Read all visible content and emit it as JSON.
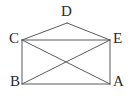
{
  "figure": {
    "type": "geometry-diagram",
    "background_color": "#ffffff",
    "stroke_color": "#5a5a5a",
    "label_color": "#2b2b2b",
    "stroke_width": 1,
    "vertices": [
      {
        "id": "D",
        "label": "D",
        "x": 67,
        "y": 23,
        "label_x": 61,
        "label_y": 4
      },
      {
        "id": "C",
        "label": "C",
        "x": 22,
        "y": 40,
        "label_x": 9,
        "label_y": 31
      },
      {
        "id": "E",
        "label": "E",
        "x": 110,
        "y": 40,
        "label_x": 113,
        "label_y": 31
      },
      {
        "id": "B",
        "label": "B",
        "x": 22,
        "y": 84,
        "label_x": 10,
        "label_y": 74
      },
      {
        "id": "A",
        "label": "A",
        "x": 110,
        "y": 84,
        "label_x": 113,
        "label_y": 74
      }
    ],
    "edges": [
      {
        "name": "edge-C-D",
        "from": "C",
        "to": "D",
        "x1": 22,
        "y1": 40,
        "x2": 67,
        "y2": 23
      },
      {
        "name": "edge-D-E",
        "from": "D",
        "to": "E",
        "x1": 67,
        "y1": 23,
        "x2": 110,
        "y2": 40
      },
      {
        "name": "edge-C-E",
        "from": "C",
        "to": "E",
        "x1": 22,
        "y1": 40,
        "x2": 110,
        "y2": 40
      },
      {
        "name": "edge-C-B",
        "from": "C",
        "to": "B",
        "x1": 22,
        "y1": 40,
        "x2": 22,
        "y2": 84
      },
      {
        "name": "edge-E-A",
        "from": "E",
        "to": "A",
        "x1": 110,
        "y1": 40,
        "x2": 110,
        "y2": 84
      },
      {
        "name": "edge-B-A",
        "from": "B",
        "to": "A",
        "x1": 22,
        "y1": 84,
        "x2": 110,
        "y2": 84
      },
      {
        "name": "diagonal-C-A",
        "from": "C",
        "to": "A",
        "x1": 22,
        "y1": 40,
        "x2": 110,
        "y2": 84
      },
      {
        "name": "diagonal-B-E",
        "from": "B",
        "to": "E",
        "x1": 22,
        "y1": 84,
        "x2": 110,
        "y2": 40
      }
    ],
    "intersection": {
      "name": "diagonal-crossing-point",
      "x": 66,
      "y": 62
    }
  }
}
